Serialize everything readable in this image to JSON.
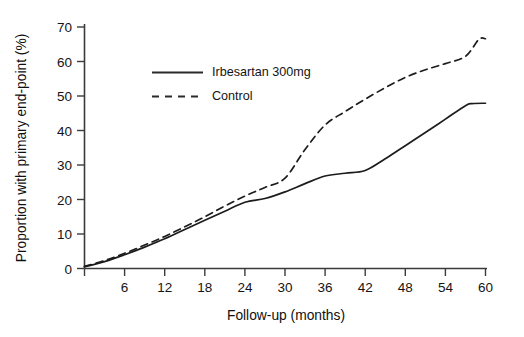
{
  "chart_data": {
    "type": "line",
    "title": "",
    "xlabel": "Follow-up (months)",
    "ylabel": "Proportion with primary end-point (%)",
    "xlim": [
      0,
      60
    ],
    "ylim": [
      0,
      70
    ],
    "xticks": [
      0,
      6,
      12,
      18,
      24,
      30,
      36,
      42,
      48,
      54,
      60
    ],
    "xticklabels": [
      "",
      "6",
      "12",
      "18",
      "24",
      "30",
      "36",
      "42",
      "48",
      "54",
      "60"
    ],
    "yticks": [
      0,
      10,
      20,
      30,
      40,
      50,
      60,
      70
    ],
    "yticklabels": [
      "0",
      "10",
      "20",
      "30",
      "40",
      "50",
      "60",
      "70"
    ],
    "grid": false,
    "legend_position": "upper center",
    "series": [
      {
        "name": "Irbesartan 300mg",
        "style": "solid",
        "color": "#1c1c1c",
        "x": [
          0,
          3,
          6,
          9,
          12,
          15,
          18,
          21,
          24,
          27,
          30,
          33,
          36,
          39,
          42,
          45,
          48,
          51,
          54,
          57,
          58,
          60
        ],
        "values": [
          0.5,
          2.0,
          4.0,
          6.2,
          8.6,
          11.3,
          14.0,
          16.6,
          19.2,
          20.3,
          22.2,
          24.6,
          26.8,
          27.6,
          28.4,
          31.8,
          35.6,
          39.4,
          43.3,
          47.2,
          47.8,
          47.9
        ]
      },
      {
        "name": "Control",
        "style": "dashed",
        "color": "#1c1c1c",
        "x": [
          0,
          3,
          6,
          9,
          12,
          15,
          18,
          21,
          24,
          27,
          30,
          33,
          36,
          39,
          42,
          45,
          48,
          51,
          54,
          57,
          59,
          60
        ],
        "values": [
          0.6,
          2.3,
          4.4,
          6.8,
          9.3,
          12.1,
          15.0,
          18.1,
          21.0,
          23.5,
          26.2,
          34.5,
          41.6,
          45.5,
          49.1,
          52.4,
          55.4,
          57.6,
          59.4,
          61.5,
          66.4,
          66.6
        ]
      }
    ]
  },
  "legend": {
    "entries": [
      {
        "label": "Irbesartan 300mg",
        "style": "solid"
      },
      {
        "label": "Control",
        "style": "dashed"
      }
    ]
  },
  "axes": {
    "y_title": "Proportion with primary end-point (%)",
    "x_title": "Follow-up (months)"
  }
}
